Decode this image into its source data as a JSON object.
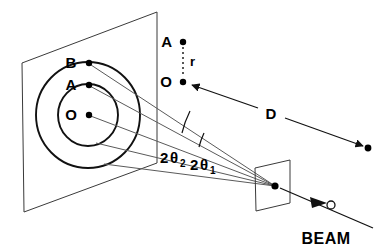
{
  "figure": {
    "type": "schematic-diagram"
  },
  "labels": {
    "point_b": "B",
    "point_a": "A",
    "point_o": "O",
    "legend_point_a": "A",
    "legend_point_o": "O",
    "radius": "r",
    "distance": "D",
    "angle2_prefix": "2",
    "angle2_theta": "θ",
    "angle2_sub": "2",
    "angle1_prefix": "2",
    "angle1_theta": "θ",
    "angle1_sub": "1",
    "beam": "BEAM"
  },
  "geometry": {
    "film_plane": {
      "corners": "22,63 157,12 157,163 24,212",
      "note": "detector film plane shown in perspective"
    },
    "rings": {
      "center": [
        88,
        115
      ],
      "inner_radius": 30,
      "outer_radius": 52,
      "count": 2
    },
    "marked_points": {
      "O": [
        88,
        115
      ],
      "A": [
        88,
        85
      ],
      "B": [
        88,
        63
      ]
    },
    "sample": {
      "corners": "255,168 290,160 290,203 256,211",
      "center": [
        275,
        186
      ]
    },
    "beam_marker": [
      330,
      205
    ],
    "distance_arrow": {
      "from": [
        183,
        82
      ],
      "to": [
        368,
        148
      ]
    }
  },
  "colors": {
    "background": "#ffffff",
    "ink": "#111111",
    "plane_line": "#3a3a3a",
    "ray_line": "#5a5a5a"
  }
}
